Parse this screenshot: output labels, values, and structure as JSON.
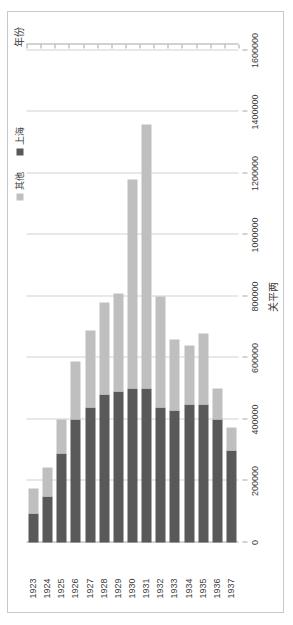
{
  "chart_data": {
    "type": "bar",
    "orientation": "vertical-rendered-rotated",
    "title": "",
    "xlabel": "年份",
    "ylabel": "关平两",
    "categories": [
      "1923",
      "1924",
      "1925",
      "1926",
      "1927",
      "1928",
      "1929",
      "1930",
      "1931",
      "1932",
      "1933",
      "1934",
      "1935",
      "1936",
      "1937"
    ],
    "series": [
      {
        "name": "上海",
        "color": "#595959",
        "values": [
          95000,
          150000,
          290000,
          400000,
          440000,
          480000,
          490000,
          500000,
          500000,
          440000,
          430000,
          450000,
          450000,
          400000,
          300000
        ]
      },
      {
        "name": "其他",
        "color": "#bfbfbf",
        "values": [
          80000,
          95000,
          110000,
          190000,
          250000,
          300000,
          320000,
          680000,
          860000,
          360000,
          230000,
          190000,
          230000,
          100000,
          75000
        ]
      }
    ],
    "stacked": true,
    "ylim": [
      0,
      1600000
    ],
    "ytick_step": 200000,
    "yticks": [
      "0",
      "200000",
      "400000",
      "600000",
      "800000",
      "1000000",
      "1200000",
      "1400000",
      "1600000"
    ],
    "grid": true,
    "legend_position": "top-right"
  },
  "legend": {
    "items": [
      {
        "label": "其他",
        "swatch": "light-gray-swatch-icon"
      },
      {
        "label": "上海",
        "swatch": "dark-gray-swatch-icon"
      }
    ]
  },
  "axes": {
    "value_axis_title": "关平两",
    "category_axis_title": "年份"
  }
}
